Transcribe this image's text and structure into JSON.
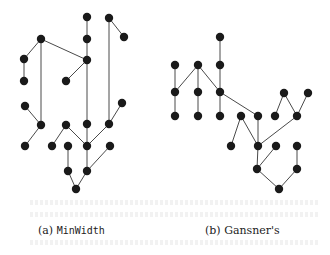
{
  "figure": {
    "panels": [
      {
        "id": "a",
        "caption_prefix": "(a) ",
        "caption_name": "MinWidth",
        "nodes": [
          [
            87,
            17
          ],
          [
            109,
            18
          ],
          [
            124,
            37
          ],
          [
            87,
            39
          ],
          [
            41,
            39
          ],
          [
            24,
            59
          ],
          [
            87,
            60
          ],
          [
            24,
            81
          ],
          [
            66,
            81
          ],
          [
            25,
            106
          ],
          [
            122,
            103
          ],
          [
            41,
            125
          ],
          [
            66,
            125
          ],
          [
            87,
            124
          ],
          [
            109,
            124
          ],
          [
            25,
            146
          ],
          [
            52,
            146
          ],
          [
            68,
            146
          ],
          [
            87,
            146
          ],
          [
            110,
            146
          ],
          [
            68,
            171
          ],
          [
            87,
            171
          ],
          [
            76,
            189
          ]
        ],
        "edges": [
          [
            [
              87,
              17
            ],
            [
              87,
              39
            ]
          ],
          [
            [
              87,
              39
            ],
            [
              87,
              60
            ]
          ],
          [
            [
              87,
              60
            ],
            [
              87,
              124
            ]
          ],
          [
            [
              87,
              124
            ],
            [
              87,
              146
            ]
          ],
          [
            [
              109,
              18
            ],
            [
              124,
              37
            ]
          ],
          [
            [
              109,
              18
            ],
            [
              109,
              124
            ]
          ],
          [
            [
              41,
              39
            ],
            [
              24,
              59
            ]
          ],
          [
            [
              24,
              59
            ],
            [
              24,
              81
            ]
          ],
          [
            [
              41,
              39
            ],
            [
              41,
              125
            ]
          ],
          [
            [
              41,
              39
            ],
            [
              87,
              60
            ]
          ],
          [
            [
              87,
              60
            ],
            [
              66,
              81
            ]
          ],
          [
            [
              25,
              106
            ],
            [
              41,
              125
            ]
          ],
          [
            [
              122,
              103
            ],
            [
              109,
              124
            ]
          ],
          [
            [
              41,
              125
            ],
            [
              25,
              146
            ]
          ],
          [
            [
              66,
              125
            ],
            [
              52,
              146
            ]
          ],
          [
            [
              66,
              125
            ],
            [
              87,
              146
            ]
          ],
          [
            [
              109,
              124
            ],
            [
              87,
              146
            ]
          ],
          [
            [
              68,
              146
            ],
            [
              68,
              171
            ]
          ],
          [
            [
              87,
              146
            ],
            [
              87,
              171
            ]
          ],
          [
            [
              110,
              146
            ],
            [
              87,
              171
            ]
          ],
          [
            [
              68,
              171
            ],
            [
              76,
              189
            ]
          ],
          [
            [
              87,
              171
            ],
            [
              76,
              189
            ]
          ]
        ]
      },
      {
        "id": "b",
        "caption_prefix": "(b) ",
        "caption_name": "Gansner's",
        "nodes": [
          [
            220,
            37
          ],
          [
            175,
            65
          ],
          [
            198,
            65
          ],
          [
            220,
            65
          ],
          [
            175,
            92
          ],
          [
            198,
            92
          ],
          [
            220,
            92
          ],
          [
            284,
            93
          ],
          [
            308,
            93
          ],
          [
            175,
            116
          ],
          [
            198,
            116
          ],
          [
            220,
            116
          ],
          [
            241,
            116
          ],
          [
            258,
            116
          ],
          [
            275,
            116
          ],
          [
            297,
            116
          ],
          [
            231,
            146
          ],
          [
            258,
            146
          ],
          [
            276,
            146
          ],
          [
            297,
            146
          ],
          [
            257,
            169
          ],
          [
            297,
            169
          ],
          [
            279,
            189
          ]
        ],
        "edges": [
          [
            [
              220,
              37
            ],
            [
              220,
              65
            ]
          ],
          [
            [
              220,
              65
            ],
            [
              220,
              92
            ]
          ],
          [
            [
              175,
              65
            ],
            [
              175,
              92
            ]
          ],
          [
            [
              198,
              65
            ],
            [
              175,
              92
            ]
          ],
          [
            [
              198,
              65
            ],
            [
              198,
              92
            ]
          ],
          [
            [
              198,
              65
            ],
            [
              220,
              92
            ]
          ],
          [
            [
              175,
              92
            ],
            [
              175,
              116
            ]
          ],
          [
            [
              198,
              92
            ],
            [
              198,
              116
            ]
          ],
          [
            [
              220,
              92
            ],
            [
              220,
              116
            ]
          ],
          [
            [
              220,
              92
            ],
            [
              258,
              116
            ]
          ],
          [
            [
              284,
              93
            ],
            [
              275,
              116
            ]
          ],
          [
            [
              284,
              93
            ],
            [
              297,
              116
            ]
          ],
          [
            [
              308,
              93
            ],
            [
              297,
              116
            ]
          ],
          [
            [
              241,
              116
            ],
            [
              231,
              146
            ]
          ],
          [
            [
              241,
              116
            ],
            [
              258,
              146
            ]
          ],
          [
            [
              258,
              116
            ],
            [
              258,
              146
            ]
          ],
          [
            [
              297,
              116
            ],
            [
              258,
              146
            ]
          ],
          [
            [
              258,
              146
            ],
            [
              257,
              169
            ]
          ],
          [
            [
              276,
              146
            ],
            [
              257,
              169
            ]
          ],
          [
            [
              297,
              146
            ],
            [
              297,
              169
            ]
          ],
          [
            [
              257,
              169
            ],
            [
              279,
              189
            ]
          ],
          [
            [
              297,
              169
            ],
            [
              279,
              189
            ]
          ]
        ]
      }
    ],
    "style": {
      "node_color": "#1a1a1a",
      "edge_color": "#4a4a4a",
      "node_radius": 4.2
    }
  }
}
